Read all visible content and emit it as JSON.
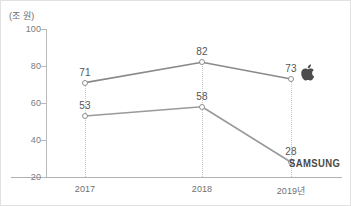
{
  "figure": {
    "unit_label": "(조 원)",
    "border_color": "#e2e2e2",
    "background": "#ffffff"
  },
  "brands": {
    "apple": {
      "name": "apple-logo",
      "color": "#4d4d4d"
    },
    "samsung": {
      "label": "SAMSUNG",
      "color": "#4a4a4a"
    }
  },
  "chart_data": {
    "type": "line",
    "title": "",
    "subtitle": "",
    "xlabel": "",
    "ylabel": "(조 원)",
    "categories": [
      "2017",
      "2018",
      "2019년"
    ],
    "series": [
      {
        "name": "Apple",
        "values": [
          71,
          82,
          73
        ],
        "labels": [
          "71",
          "82",
          "73"
        ],
        "color": "#8a8a8a",
        "marker": "open-circle",
        "end_logo": "apple-logo"
      },
      {
        "name": "Samsung",
        "values": [
          53,
          58,
          28
        ],
        "labels": [
          "53",
          "58",
          "28"
        ],
        "color": "#9a9a9a",
        "marker": "open-circle",
        "end_logo": "samsung-wordmark"
      }
    ],
    "ylim": [
      20,
      100
    ],
    "yticks": [
      20,
      40,
      60,
      80,
      100
    ],
    "ytick_labels": [
      "20",
      "40",
      "60",
      "80",
      "100"
    ],
    "grid": "vertical-dotted",
    "legend": "inline-brand-marks"
  }
}
